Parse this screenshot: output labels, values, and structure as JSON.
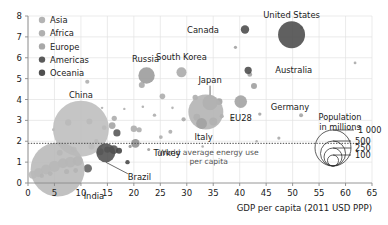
{
  "chart_data": {
    "type": "scatter",
    "title": "",
    "xlabel": "GDP per capita (2011 USD PPP)",
    "ylabel": "",
    "xlim": [
      0,
      65
    ],
    "ylim": [
      0,
      8
    ],
    "xticks": [
      "0",
      "5",
      "10",
      "15",
      "20",
      "25",
      "30",
      "35",
      "40",
      "45",
      "50",
      "55",
      "60",
      "65"
    ],
    "yticks": [
      "0",
      "1",
      "2",
      "3",
      "4",
      "5",
      "6",
      "7",
      "8"
    ],
    "grid": true,
    "size_encodes": "Population in millions",
    "annotations": [
      {
        "text_line1": "World average energy use",
        "text_line2": "per capita",
        "y_value": 1.9
      }
    ],
    "legend": {
      "position": "top-left",
      "entries": [
        {
          "label": "Asia",
          "color": "#b4b4b4"
        },
        {
          "label": "Africa",
          "color": "#b0b0b0"
        },
        {
          "label": "Europe",
          "color": "#a8a8a8"
        },
        {
          "label": "Americas",
          "color": "#5a5a5a"
        },
        {
          "label": "Oceania",
          "color": "#4f4f4f"
        }
      ]
    },
    "size_legend": {
      "title_line1": "Population",
      "title_line2": "in millions",
      "values": [
        "1 000",
        "500",
        "250",
        "100"
      ]
    },
    "points": [
      {
        "name": "United States",
        "x": 49.8,
        "y": 7.1,
        "pop": 320,
        "continent": "Americas",
        "r": 13.5,
        "color": "#4a4a4a",
        "labeled": true,
        "label_dx": 0,
        "label_dy": -17,
        "leader": false
      },
      {
        "name": "Canada",
        "x": 41.0,
        "y": 7.35,
        "pop": 36,
        "continent": "Americas",
        "r": 4.2,
        "color": "#4a4a4a",
        "labeled": true,
        "label_dx": -26,
        "label_dy": 3,
        "leader": false
      },
      {
        "name": "Australia",
        "x": 41.6,
        "y": 5.4,
        "pop": 24,
        "continent": "Oceania",
        "r": 3.6,
        "color": "#4a4a4a",
        "labeled": true,
        "label_dx": 27,
        "label_dy": 3,
        "leader": false
      },
      {
        "name": "Russia",
        "x": 22.4,
        "y": 5.15,
        "pop": 144,
        "continent": "Europe",
        "r": 8.2,
        "color": "#9a9a9a",
        "labeled": true,
        "label_dx": -1,
        "label_dy": -13,
        "leader": false
      },
      {
        "name": "South Korea",
        "x": 29.0,
        "y": 5.3,
        "pop": 51,
        "continent": "Asia",
        "r": 5.0,
        "color": "#a8a8a8",
        "labeled": true,
        "label_dx": 0,
        "label_dy": -12,
        "leader": false
      },
      {
        "name": "Japan",
        "x": 34.4,
        "y": 3.85,
        "pop": 127,
        "continent": "Asia",
        "r": 7.6,
        "color": "#a8a8a8",
        "labeled": true,
        "label_dx": 0,
        "label_dy": -20,
        "leader": true
      },
      {
        "name": "Germany",
        "x": 40.2,
        "y": 3.9,
        "pop": 82,
        "continent": "Europe",
        "r": 6.3,
        "color": "#a0a0a0",
        "labeled": true,
        "label_dx": 30,
        "label_dy": 8,
        "leader": false
      },
      {
        "name": "EU28",
        "x": 33.6,
        "y": 3.4,
        "pop": 510,
        "continent": "Europe",
        "r": 17.5,
        "color": "#b2b2b2",
        "labeled": true,
        "label_dx": 24,
        "label_dy": 9,
        "leader": false
      },
      {
        "name": "Italy",
        "x": 32.8,
        "y": 2.85,
        "pop": 60,
        "continent": "Europe",
        "r": 5.4,
        "color": "#a0a0a0",
        "labeled": true,
        "label_dx": 2,
        "label_dy": 16,
        "leader": false
      },
      {
        "name": "China",
        "x": 10.0,
        "y": 2.6,
        "pop": 1390,
        "continent": "Asia",
        "r": 28.0,
        "color": "#bdbdbd",
        "labeled": true,
        "label_dx": 0,
        "label_dy": -31,
        "leader": false
      },
      {
        "name": "India",
        "x": 5.6,
        "y": 0.65,
        "pop": 1330,
        "continent": "Asia",
        "r": 27.0,
        "color": "#b8b8b8",
        "labeled": true,
        "label_dx": 26,
        "label_dy": 30,
        "leader": false
      },
      {
        "name": "Brazil",
        "x": 14.7,
        "y": 1.45,
        "pop": 208,
        "continent": "Americas",
        "r": 9.5,
        "color": "#4f4f4f",
        "labeled": true,
        "label_dx": 22,
        "label_dy": 27,
        "leader": true
      },
      {
        "name": "Turkey",
        "x": 20.3,
        "y": 1.9,
        "pop": 80,
        "continent": "Asia",
        "r": 4.3,
        "color": "#8e8e8e",
        "labeled": true,
        "label_dx": 18,
        "label_dy": 13,
        "leader": false
      }
    ],
    "unlabeled_points": [
      {
        "x": 11.2,
        "y": 4.85,
        "r": 2.1,
        "color": "#aaaaaa"
      },
      {
        "x": 21.5,
        "y": 4.7,
        "r": 3.0,
        "color": "#a5a5a5"
      },
      {
        "x": 25.4,
        "y": 4.15,
        "r": 2.8,
        "color": "#a8a8a8"
      },
      {
        "x": 31.6,
        "y": 4.1,
        "r": 2.7,
        "color": "#a8a8a8"
      },
      {
        "x": 36.1,
        "y": 3.9,
        "r": 3.4,
        "color": "#9e9e9e"
      },
      {
        "x": 42.7,
        "y": 4.65,
        "r": 3.0,
        "color": "#9a9a9a"
      },
      {
        "x": 41.9,
        "y": 5.2,
        "r": 2.4,
        "color": "#9c9c9c"
      },
      {
        "x": 39.2,
        "y": 6.5,
        "r": 1.6,
        "color": "#9c9c9c"
      },
      {
        "x": 51.7,
        "y": 7.45,
        "r": 1.5,
        "color": "#a5a5a5"
      },
      {
        "x": 61.8,
        "y": 5.75,
        "r": 1.4,
        "color": "#a5a5a5"
      },
      {
        "x": 51.6,
        "y": 3.25,
        "r": 2.0,
        "color": "#a0a0a0"
      },
      {
        "x": 47.4,
        "y": 2.15,
        "r": 1.6,
        "color": "#a5a5a5"
      },
      {
        "x": 43.8,
        "y": 3.3,
        "r": 1.7,
        "color": "#a0a0a0"
      },
      {
        "x": 29.4,
        "y": 3.05,
        "r": 2.1,
        "color": "#a5a5a5"
      },
      {
        "x": 26.9,
        "y": 2.45,
        "r": 2.0,
        "color": "#a8a8a8"
      },
      {
        "x": 25.1,
        "y": 2.2,
        "r": 1.9,
        "color": "#aaaaaa"
      },
      {
        "x": 23.9,
        "y": 3.25,
        "r": 1.7,
        "color": "#a8a8a8"
      },
      {
        "x": 27.3,
        "y": 3.6,
        "r": 1.3,
        "color": "#aaaaaa"
      },
      {
        "x": 20.0,
        "y": 2.6,
        "r": 3.2,
        "color": "#a8a8a8"
      },
      {
        "x": 21.0,
        "y": 2.55,
        "r": 2.6,
        "color": "#a8a8a8"
      },
      {
        "x": 16.3,
        "y": 3.1,
        "r": 2.6,
        "color": "#a8a8a8"
      },
      {
        "x": 15.9,
        "y": 2.75,
        "r": 3.4,
        "color": "#a0a0a0"
      },
      {
        "x": 16.8,
        "y": 2.4,
        "r": 3.6,
        "color": "#4f4f4f"
      },
      {
        "x": 18.8,
        "y": 1.0,
        "r": 2.2,
        "color": "#3f3f3f"
      },
      {
        "x": 17.2,
        "y": 1.55,
        "r": 3.0,
        "color": "#3a3a3a"
      },
      {
        "x": 16.2,
        "y": 1.6,
        "r": 4.4,
        "color": "#4a4a4a"
      },
      {
        "x": 15.0,
        "y": 1.6,
        "r": 3.2,
        "color": "#6a6a6a"
      },
      {
        "x": 13.6,
        "y": 1.5,
        "r": 3.6,
        "color": "#8a8a8a"
      },
      {
        "x": 11.3,
        "y": 0.7,
        "r": 4.2,
        "color": "#5a5a5a"
      },
      {
        "x": 9.4,
        "y": 1.05,
        "r": 5.0,
        "color": "#9a9a9a"
      },
      {
        "x": 8.0,
        "y": 1.0,
        "r": 5.4,
        "color": "#a5a5a5"
      },
      {
        "x": 6.6,
        "y": 0.95,
        "r": 5.0,
        "color": "#aaaaaa"
      },
      {
        "x": 5.0,
        "y": 0.8,
        "r": 5.6,
        "color": "#b0b0b0"
      },
      {
        "x": 3.4,
        "y": 0.65,
        "r": 5.0,
        "color": "#b2b2b2"
      },
      {
        "x": 2.0,
        "y": 0.5,
        "r": 4.6,
        "color": "#b4b4b4"
      },
      {
        "x": 0.9,
        "y": 0.4,
        "r": 4.0,
        "color": "#b6b6b6"
      },
      {
        "x": 7.3,
        "y": 0.55,
        "r": 2.6,
        "color": "#8e8e8e"
      },
      {
        "x": 9.0,
        "y": 0.6,
        "r": 2.4,
        "color": "#8a8a8a"
      },
      {
        "x": 4.2,
        "y": 0.45,
        "r": 2.4,
        "color": "#909090"
      },
      {
        "x": 2.6,
        "y": 0.35,
        "r": 2.2,
        "color": "#949494"
      },
      {
        "x": 6.0,
        "y": 1.45,
        "r": 3.0,
        "color": "#a8a8a8"
      },
      {
        "x": 8.6,
        "y": 1.6,
        "r": 3.2,
        "color": "#a8a8a8"
      },
      {
        "x": 12.0,
        "y": 1.75,
        "r": 3.0,
        "color": "#a8a8a8"
      },
      {
        "x": 12.9,
        "y": 2.0,
        "r": 2.2,
        "color": "#9a9a9a"
      },
      {
        "x": 7.6,
        "y": 2.9,
        "r": 3.2,
        "color": "#9e9e9e"
      },
      {
        "x": 11.6,
        "y": 2.95,
        "r": 3.0,
        "color": "#9e9e9e"
      },
      {
        "x": 14.4,
        "y": 2.65,
        "r": 2.4,
        "color": "#a0a0a0"
      },
      {
        "x": 35.0,
        "y": 2.95,
        "r": 4.0,
        "color": "#a5a5a5"
      },
      {
        "x": 31.9,
        "y": 3.15,
        "r": 3.4,
        "color": "#a5a5a5"
      },
      {
        "x": 36.6,
        "y": 3.2,
        "r": 2.1,
        "color": "#a8a8a8"
      },
      {
        "x": 38.6,
        "y": 3.1,
        "r": 1.5,
        "color": "#aaaaaa"
      },
      {
        "x": 19.3,
        "y": 1.75,
        "r": 1.6,
        "color": "#8e8e8e"
      },
      {
        "x": 22.8,
        "y": 1.6,
        "r": 1.5,
        "color": "#9a9a9a"
      },
      {
        "x": 33.0,
        "y": 1.75,
        "r": 1.3,
        "color": "#a5a5a5"
      },
      {
        "x": 21.7,
        "y": 3.65,
        "r": 1.3,
        "color": "#a8a8a8"
      },
      {
        "x": 18.2,
        "y": 3.55,
        "r": 1.2,
        "color": "#aaaaaa"
      },
      {
        "x": 14.0,
        "y": 3.6,
        "r": 1.2,
        "color": "#aaaaaa"
      },
      {
        "x": 4.8,
        "y": 2.55,
        "r": 1.4,
        "color": "#b0b0b0"
      },
      {
        "x": 43.2,
        "y": 2.0,
        "r": 1.2,
        "color": "#a5a5a5"
      }
    ]
  }
}
